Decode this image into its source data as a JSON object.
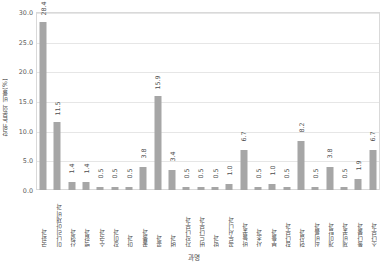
{
  "chart_data": {
    "type": "bar",
    "title": "",
    "xlabel": "과명",
    "ylabel": "학위논문의 비율(%)",
    "ylim": [
      0,
      30.0
    ],
    "ytick_labels": [
      "0.0",
      "5.0",
      "10.0",
      "15.0",
      "20.0",
      "25.0",
      "30.0"
    ],
    "ytick_values": [
      0.0,
      5.0,
      10.0,
      15.0,
      20.0,
      25.0,
      30.0
    ],
    "grid": true,
    "legend": "none",
    "bar_color": "#a6a6a6",
    "categories": [
      "국화과",
      "미나리아재비과",
      "산형과",
      "백합과",
      "수국과",
      "장미과",
      "마과",
      "꿀풀과",
      "콩과",
      "벼과",
      "자작나무과",
      "버드나무과",
      "박과",
      "꼭두서니과",
      "바늘꽃과",
      "사초과",
      "부들과",
      "참나무과",
      "현삼과",
      "쇠비름과",
      "개미탑과",
      "제비꽃과",
      "돌나물과",
      "소나무과"
    ],
    "values": [
      28.4,
      11.5,
      1.4,
      1.4,
      0.5,
      0.5,
      0.5,
      3.8,
      15.9,
      3.4,
      0.5,
      0.5,
      0.5,
      1.0,
      6.7,
      0.5,
      1.0,
      0.5,
      8.2,
      0.5,
      3.8,
      0.5,
      1.9,
      6.7
    ],
    "value_labels": [
      "28.4",
      "11.5",
      "1.4",
      "1.4",
      "0.5",
      "0.5",
      "0.5",
      "3.8",
      "15.9",
      "3.4",
      "0.5",
      "0.5",
      "0.5",
      "1.0",
      "6.7",
      "0.5",
      "1.0",
      "0.5",
      "8.2",
      "0.5",
      "3.8",
      "0.5",
      "1.9",
      "6.7"
    ]
  }
}
